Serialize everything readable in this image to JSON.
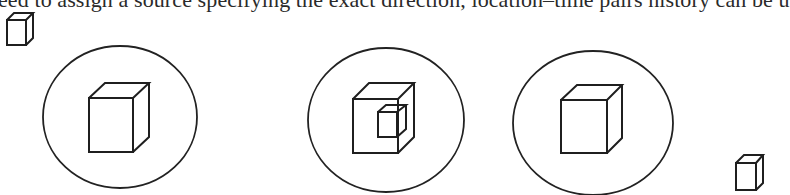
{
  "text": {
    "partial_top_line": "eed to assign a source specifying the exact direction, location–time pairs history can be u"
  },
  "figure": {
    "colors": {
      "stroke": "#1f1f1f",
      "background": "#ffffff"
    },
    "elements": [
      {
        "id": "small-cube-top-left",
        "type": "cube",
        "description": "small standalone cube outside circles"
      },
      {
        "id": "circle-1",
        "type": "circle",
        "contains": [
          "single cube"
        ]
      },
      {
        "id": "circle-2",
        "type": "circle",
        "contains": [
          "large cube",
          "small cube nested inside"
        ]
      },
      {
        "id": "circle-3",
        "type": "circle",
        "contains": [
          "single cube"
        ]
      },
      {
        "id": "small-cube-bottom-right",
        "type": "cube",
        "description": "small standalone cube outside circles"
      }
    ]
  }
}
